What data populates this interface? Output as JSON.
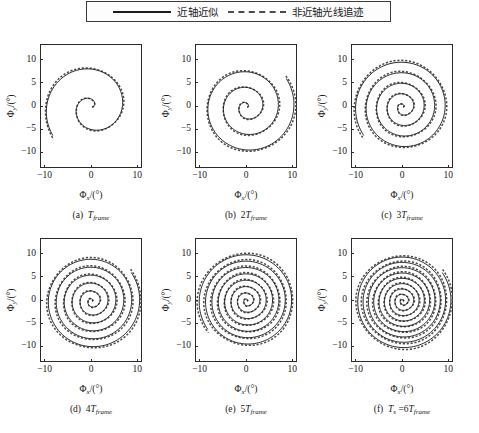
{
  "legend": {
    "entries": [
      {
        "style": "solid",
        "label": "近轴近似"
      },
      {
        "style": "dashed",
        "label": "非近轴光线追迹"
      }
    ]
  },
  "axes": {
    "xlabel": "Φ",
    "xlabel_sub": "x",
    "xlabel_unit": "/(°)",
    "ylabel": "Φ",
    "ylabel_sub": "y",
    "ylabel_unit": "/(°)",
    "xticks": [
      "−10",
      "0",
      "10"
    ],
    "yticks": [
      "10",
      "5",
      "0",
      "−5",
      "−10"
    ],
    "xlim": [
      -11,
      11
    ],
    "ylim": [
      -11,
      11
    ]
  },
  "panels": [
    {
      "tag": "(a)",
      "caption_prefix": "",
      "caption_symbol": "T",
      "caption_sub": "frame",
      "caption_full": "(a)  T frame",
      "turns": 1.6
    },
    {
      "tag": "(b)",
      "caption_prefix": "2",
      "caption_symbol": "T",
      "caption_sub": "frame",
      "caption_full": "(b)  2T frame",
      "turns": 3.1
    },
    {
      "tag": "(c)",
      "caption_prefix": "3",
      "caption_symbol": "T",
      "caption_sub": "frame",
      "caption_full": "(c)  3T frame",
      "turns": 4.6
    },
    {
      "tag": "(d)",
      "caption_prefix": "4",
      "caption_symbol": "T",
      "caption_sub": "frame",
      "caption_full": "(d)  4T frame",
      "turns": 6.1
    },
    {
      "tag": "(e)",
      "caption_prefix": "5",
      "caption_symbol": "T",
      "caption_sub": "frame",
      "caption_full": "(e)  5T frame",
      "turns": 7.6
    },
    {
      "tag": "(f)",
      "caption_prefix": "T s =6",
      "caption_symbol": "T",
      "caption_sub": "frame",
      "caption_full": "(f)  T s =6T frame",
      "turns": 9.1
    }
  ],
  "colors": {
    "solid_line": "#1c1c1c",
    "dashed_line": "#4a4a4a",
    "axis": "#2b2b2b",
    "background": "#ffffff"
  },
  "chart_data": {
    "type": "line",
    "title": "",
    "xlabel": "Φx/(°)",
    "ylabel": "Φy/(°)",
    "xlim": [
      -11,
      11
    ],
    "ylim": [
      -11,
      11
    ],
    "xticks": [
      -10,
      0,
      10
    ],
    "yticks": [
      -10,
      -5,
      0,
      5,
      10
    ],
    "grid": false,
    "legend_position": "top-center",
    "subplots": [
      {
        "label": "(a) T_frame",
        "turns": 1.6,
        "r_max": 10.4,
        "series": [
          {
            "name": "近轴近似",
            "style": "solid"
          },
          {
            "name": "非近轴光线追迹",
            "style": "dashed"
          }
        ]
      },
      {
        "label": "(b) 2T_frame",
        "turns": 3.1,
        "r_max": 10.4,
        "series": [
          {
            "name": "近轴近似",
            "style": "solid"
          },
          {
            "name": "非近轴光线追迹",
            "style": "dashed"
          }
        ]
      },
      {
        "label": "(c) 3T_frame",
        "turns": 4.6,
        "r_max": 10.4,
        "series": [
          {
            "name": "近轴近似",
            "style": "solid"
          },
          {
            "name": "非近轴光线追迹",
            "style": "dashed"
          }
        ]
      },
      {
        "label": "(d) 4T_frame",
        "turns": 6.1,
        "r_max": 10.4,
        "series": [
          {
            "name": "近轴近似",
            "style": "solid"
          },
          {
            "name": "非近轴光线追迹",
            "style": "dashed"
          }
        ]
      },
      {
        "label": "(e) 5T_frame",
        "turns": 7.6,
        "r_max": 10.4,
        "series": [
          {
            "name": "近轴近似",
            "style": "solid"
          },
          {
            "name": "非近轴光线追迹",
            "style": "dashed"
          }
        ]
      },
      {
        "label": "(f) T_s = 6T_frame",
        "turns": 9.1,
        "r_max": 10.4,
        "series": [
          {
            "name": "近轴近似",
            "style": "solid"
          },
          {
            "name": "非近轴光线追迹",
            "style": "dashed"
          }
        ]
      }
    ]
  }
}
